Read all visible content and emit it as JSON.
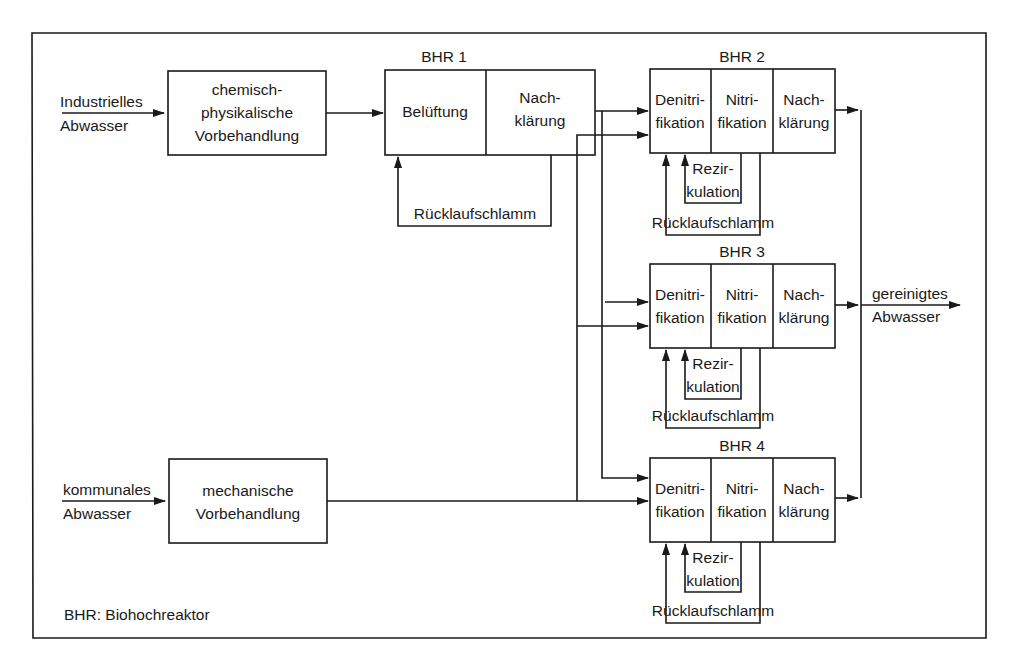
{
  "legend": "BHR: Biohochreaktor",
  "inputs": {
    "industrial": {
      "line1": "Industrielles",
      "line2": "Abwasser"
    },
    "municipal": {
      "line1": "kommunales",
      "line2": "Abwasser"
    }
  },
  "output": {
    "line1": "gereinigtes",
    "line2": "Abwasser"
  },
  "pretreatment": {
    "chemical": {
      "line1": "chemisch-",
      "line2": "physikalische",
      "line3": "Vorbehandlung"
    },
    "mechanical": {
      "line1": "mechanische",
      "line2": "Vorbehandlung"
    }
  },
  "bhr1": {
    "title": "BHR 1",
    "stage1": "Belüftung",
    "stage2": {
      "line1": "Nach-",
      "line2": "klärung"
    },
    "return": "Rücklaufschlamm"
  },
  "reactors": [
    {
      "title": "BHR 2",
      "denit": {
        "line1": "Denitri-",
        "line2": "fikation"
      },
      "nit": {
        "line1": "Nitri-",
        "line2": "fikation"
      },
      "clar": {
        "line1": "Nach-",
        "line2": "klärung"
      },
      "recirc": {
        "line1": "Rezir-",
        "line2": "kulation"
      },
      "return": "Rücklaufschlamm"
    },
    {
      "title": "BHR 3",
      "denit": {
        "line1": "Denitri-",
        "line2": "fikation"
      },
      "nit": {
        "line1": "Nitri-",
        "line2": "fikation"
      },
      "clar": {
        "line1": "Nach-",
        "line2": "klärung"
      },
      "recirc": {
        "line1": "Rezir-",
        "line2": "kulation"
      },
      "return": "Rücklaufschlamm"
    },
    {
      "title": "BHR 4",
      "denit": {
        "line1": "Denitri-",
        "line2": "fikation"
      },
      "nit": {
        "line1": "Nitri-",
        "line2": "fikation"
      },
      "clar": {
        "line1": "Nach-",
        "line2": "klärung"
      },
      "recirc": {
        "line1": "Rezir-",
        "line2": "kulation"
      },
      "return": "Rücklaufschlamm"
    }
  ]
}
